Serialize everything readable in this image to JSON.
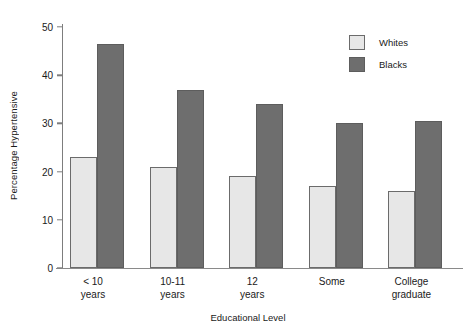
{
  "chart_data": {
    "type": "bar",
    "title": "",
    "xlabel": "Educational Level",
    "ylabel": "Percentage Hypertensive",
    "categories": [
      "< 10 years",
      "10-11 years",
      "12 years",
      "Some",
      "College graduate"
    ],
    "category_lines": [
      [
        "< 10",
        "years"
      ],
      [
        "10-11",
        "years"
      ],
      [
        "12",
        "years"
      ],
      [
        "Some",
        ""
      ],
      [
        "College",
        "graduate"
      ]
    ],
    "series": [
      {
        "name": "Whites",
        "color": "#e7e7e7",
        "values": [
          23,
          21,
          19,
          17,
          16
        ]
      },
      {
        "name": "Blacks",
        "color": "#6e6e6e",
        "values": [
          46.5,
          37,
          34,
          30,
          30.5
        ]
      }
    ],
    "ylim": [
      0,
      50
    ],
    "yticks": [
      0,
      10,
      20,
      30,
      40,
      50
    ],
    "ytick_labels": [
      "0",
      "10",
      "20",
      "30",
      "40",
      "50"
    ],
    "grid": false,
    "legend_position": "top-right",
    "background": "#ffffff"
  },
  "legend": {
    "entries": [
      {
        "label": "Whites",
        "swatch": "whites"
      },
      {
        "label": "Blacks",
        "swatch": "blacks"
      }
    ]
  }
}
